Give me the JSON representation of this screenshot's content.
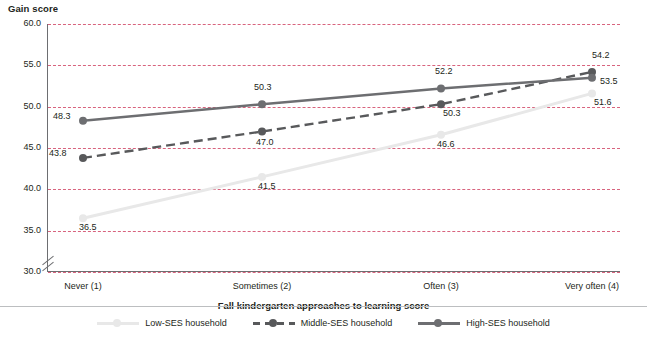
{
  "chart_data": {
    "type": "line",
    "title": "",
    "ylabel": "Gain score",
    "xlabel": "Fall kindergarten approaches to learning score",
    "categories": [
      "Never (1)",
      "Sometimes (2)",
      "Often (3)",
      "Very often (4)"
    ],
    "ylim": [
      30.0,
      60.0
    ],
    "yticks": [
      "30.0",
      "35.0",
      "40.0",
      "45.0",
      "50.0",
      "55.0",
      "60.0"
    ],
    "grid": true,
    "axis_break": true,
    "legend_position": "bottom",
    "series": [
      {
        "name": "Low-SES household",
        "color": "#e8e8e8",
        "style": "solid",
        "values": [
          36.5,
          41.5,
          46.6,
          51.6
        ],
        "labels": [
          "36.5",
          "41.5",
          "46.6",
          "51.6"
        ]
      },
      {
        "name": "Middle-SES household",
        "color": "#58595b",
        "style": "dashed",
        "values": [
          43.8,
          47.0,
          50.3,
          54.2
        ],
        "labels": [
          "43.8",
          "47.0",
          "50.3",
          "54.2"
        ]
      },
      {
        "name": "High-SES household",
        "color": "#6d6e71",
        "style": "solid",
        "values": [
          48.3,
          50.3,
          52.2,
          53.5
        ],
        "labels": [
          "48.3",
          "50.3",
          "52.2",
          "53.5"
        ]
      }
    ]
  },
  "colors": {
    "gridline": "#d24a68",
    "axis": "#6d6e71",
    "text": "#231f20"
  }
}
